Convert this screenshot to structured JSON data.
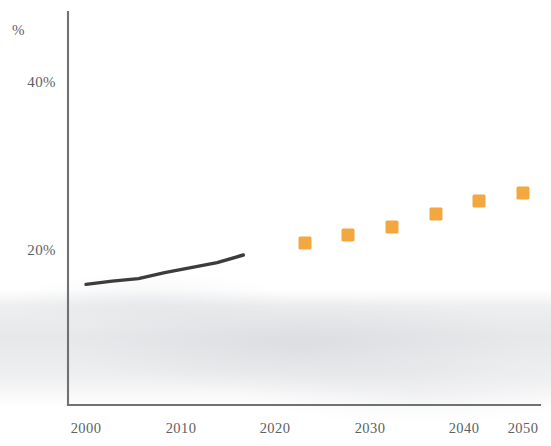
{
  "chart": {
    "axis_title_y": "%",
    "y_ticks": [
      "20%",
      "40%"
    ],
    "x_ticks": [
      "2000",
      "2010",
      "2020",
      "2030",
      "2040",
      "2050"
    ],
    "colors": {
      "projection_marker": "#F2A83E",
      "historical_line": "#3a3c3e",
      "axis": "#6e7276",
      "label_text": "#5d6165"
    }
  },
  "chart_data": {
    "type": "line",
    "title": "",
    "subtitle": "",
    "xlabel": "",
    "ylabel": "%",
    "xlim": [
      2000,
      2050
    ],
    "ylim": [
      0,
      47
    ],
    "grid": false,
    "legend": "none",
    "y_tick_values": [
      20,
      40
    ],
    "y_tick_labels": [
      "20%",
      "40%"
    ],
    "x_tick_values": [
      2000,
      2010,
      2020,
      2030,
      2040,
      2050
    ],
    "x_tick_labels": [
      "2000",
      "2010",
      "2020",
      "2030",
      "2040",
      "2050"
    ],
    "series": [
      {
        "name": "Historical",
        "type": "line",
        "style": "solid-dark-line",
        "color": "#3a3c3e",
        "x": [
          2000,
          2003,
          2006,
          2009,
          2012,
          2015,
          2018
        ],
        "values": [
          15.9,
          16.3,
          16.6,
          17.3,
          17.9,
          18.5,
          19.4
        ]
      },
      {
        "name": "Projection",
        "type": "scatter",
        "style": "orange-square-markers",
        "color": "#F2A83E",
        "x": [
          2025,
          2030,
          2035,
          2040,
          2045,
          2050
        ],
        "values": [
          20.8,
          21.8,
          22.7,
          24.3,
          25.8,
          26.8
        ]
      }
    ]
  }
}
